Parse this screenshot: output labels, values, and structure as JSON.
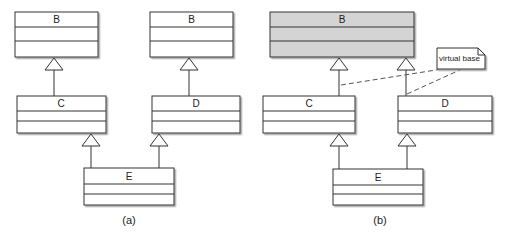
{
  "diagram": {
    "type": "uml-class-diagram",
    "panels": [
      {
        "id": "a",
        "caption": "(a)",
        "classes": [
          {
            "name": "B",
            "shaded": false
          },
          {
            "name": "B",
            "shaded": false
          },
          {
            "name": "C",
            "shaded": false
          },
          {
            "name": "D",
            "shaded": false
          },
          {
            "name": "E",
            "shaded": false
          }
        ],
        "relations": [
          {
            "from": "C",
            "to": "B (left)",
            "kind": "generalization"
          },
          {
            "from": "D",
            "to": "B (right)",
            "kind": "generalization"
          },
          {
            "from": "E",
            "to": "C",
            "kind": "generalization"
          },
          {
            "from": "E",
            "to": "D",
            "kind": "generalization"
          }
        ]
      },
      {
        "id": "b",
        "caption": "(b)",
        "classes": [
          {
            "name": "B",
            "shaded": true
          },
          {
            "name": "C",
            "shaded": false
          },
          {
            "name": "D",
            "shaded": false
          },
          {
            "name": "E",
            "shaded": false
          }
        ],
        "note": {
          "text": "virtual base"
        },
        "relations": [
          {
            "from": "C",
            "to": "B",
            "kind": "generalization"
          },
          {
            "from": "D",
            "to": "B",
            "kind": "generalization"
          },
          {
            "from": "E",
            "to": "C",
            "kind": "generalization"
          },
          {
            "from": "E",
            "to": "D",
            "kind": "generalization"
          },
          {
            "from": "note",
            "to": "C-B link",
            "kind": "note-anchor"
          },
          {
            "from": "note",
            "to": "D-B link",
            "kind": "note-anchor"
          }
        ]
      }
    ],
    "colors": {
      "line": "#333333",
      "box_fill": "#ffffff",
      "shaded_fill": "#d4d4d4",
      "shadow": "#9a9a9a"
    }
  }
}
